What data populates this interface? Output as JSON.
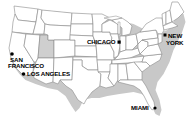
{
  "map": {
    "type": "US state outline map",
    "highlighted_state": "Utah",
    "colors": {
      "background": "#ffffff",
      "state_fill": "#ffffff",
      "state_border": "#8a8a8a",
      "highlight_fill": "#cfcfcf",
      "shadow": "#c8c8c8",
      "marker": "#000000",
      "label": "#000000"
    },
    "cities": [
      {
        "name": "San Francisco",
        "label_line1": "SAN",
        "label_line2": "FRANCISCO",
        "x": 12,
        "y": 55
      },
      {
        "name": "Los Angeles",
        "label_line1": "LOS ANGELES",
        "x": 23,
        "y": 73
      },
      {
        "name": "Chicago",
        "label_line1": "CHICAGO",
        "x": 119,
        "y": 42
      },
      {
        "name": "New York",
        "label_line1": "NEW",
        "label_line2": "YORK",
        "x": 164,
        "y": 35
      },
      {
        "name": "Miami",
        "label_line1": "MIAMI",
        "x": 154,
        "y": 107
      }
    ]
  }
}
